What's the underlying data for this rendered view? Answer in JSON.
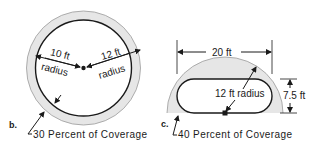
{
  "colors": {
    "ink": "#1a1a1a",
    "coverage_fill": "#e6e6e6",
    "background": "#ffffff"
  },
  "diagram_b": {
    "label": "b.",
    "radius_inner_value": "10 ft",
    "radius_inner_unit": "radius",
    "radius_outer_value": "12 ft",
    "radius_outer_unit": "radius",
    "coverage_caption": "30 Percent of Coverage"
  },
  "diagram_c": {
    "label": "c.",
    "width_dimension": "20 ft",
    "radius_label": "12 ft radius",
    "height_dimension": "7.5 ft",
    "coverage_caption": "40 Percent of Coverage"
  }
}
